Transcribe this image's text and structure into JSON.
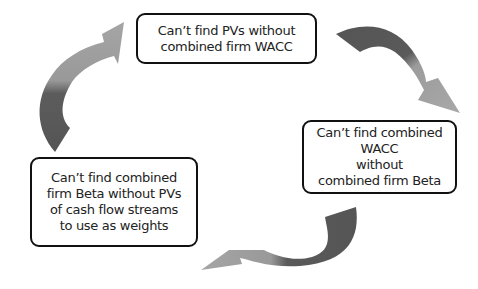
{
  "diagram": {
    "type": "circular-dependency-cycle",
    "nodes": [
      {
        "id": "top",
        "text": "Can’t find PVs without\ncombined firm WACC"
      },
      {
        "id": "right",
        "text": "Can’t find combined WACC\nwithout\ncombined firm Beta"
      },
      {
        "id": "left",
        "text": "Can’t find combined\nfirm Beta without PVs\nof cash flow streams\nto use as weights"
      }
    ],
    "edges": [
      {
        "from": "top",
        "to": "right"
      },
      {
        "from": "right",
        "to": "left"
      },
      {
        "from": "left",
        "to": "top"
      }
    ],
    "colors": {
      "arrow_dark": "#5a5a5a",
      "arrow_light": "#a3a3a3",
      "border": "#111111"
    }
  }
}
